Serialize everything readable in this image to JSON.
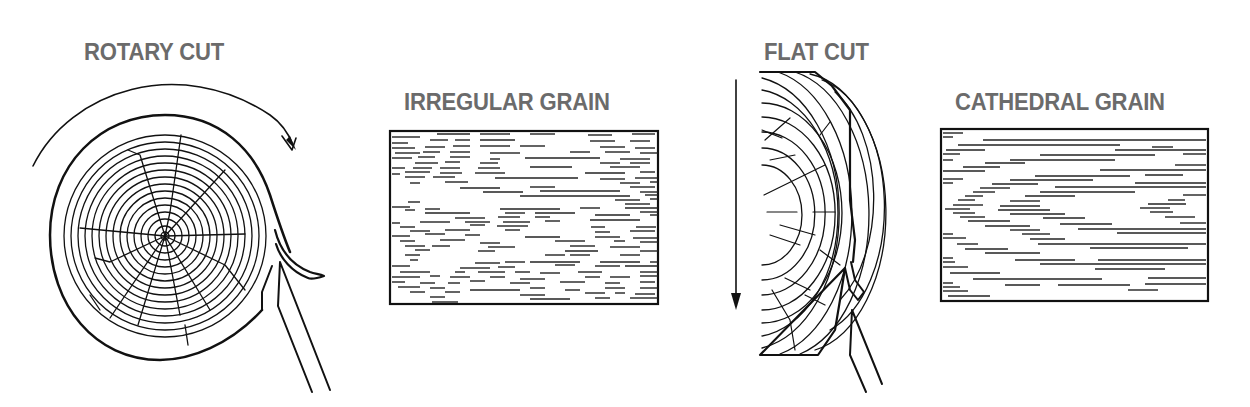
{
  "diagram": {
    "colors": {
      "label": "#6b6b6b",
      "line": "#111111",
      "background": "#ffffff"
    },
    "panels": [
      {
        "id": "rotary-cut",
        "label": "ROTARY CUT",
        "type": "log-cross-section",
        "motion": "clockwise rotation arrow",
        "tool": "knife blade peeling veneer"
      },
      {
        "id": "irregular-grain",
        "label": "IRREGULAR GRAIN",
        "type": "veneer-sheet",
        "pattern": "irregular"
      },
      {
        "id": "flat-cut",
        "label": "FLAT CUT",
        "type": "half-log-flitch",
        "motion": "downward arrow",
        "tool": "knife blade slicing veneer"
      },
      {
        "id": "cathedral-grain",
        "label": "CATHEDRAL GRAIN",
        "type": "veneer-sheet",
        "pattern": "cathedral"
      }
    ]
  }
}
